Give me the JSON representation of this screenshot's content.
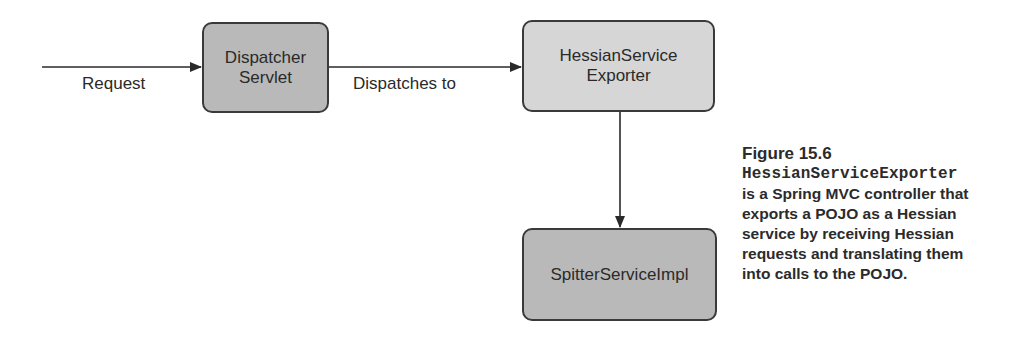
{
  "diagram": {
    "nodes": [
      {
        "id": "dispatcher",
        "lines": [
          "Dispatcher",
          "Servlet"
        ],
        "fill": "#b9b9b9"
      },
      {
        "id": "exporter",
        "lines": [
          "HessianService",
          "Exporter"
        ],
        "fill": "#d6d6d6"
      },
      {
        "id": "impl",
        "lines": [
          "SpitterServiceImpl"
        ],
        "fill": "#b9b9b9"
      }
    ],
    "edges": [
      {
        "from": "external",
        "to": "dispatcher",
        "label": "Request"
      },
      {
        "from": "dispatcher",
        "to": "exporter",
        "label": "Dispatches to"
      },
      {
        "from": "exporter",
        "to": "impl",
        "label": ""
      }
    ]
  },
  "caption": {
    "figure_number": "Figure 15.6",
    "code_term": "HessianServiceExporter",
    "lines": [
      "is a Spring MVC controller that",
      "exports a POJO as a Hessian",
      "service by receiving Hessian",
      "requests and translating them",
      "into calls to the POJO."
    ]
  }
}
